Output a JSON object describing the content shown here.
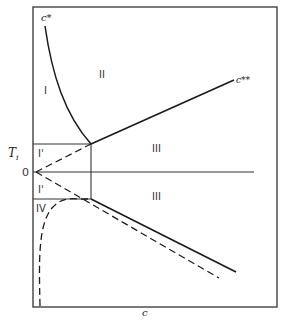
{
  "diagram": {
    "type": "phase-diagram",
    "axis": {
      "x_label": "c",
      "y_label": "T",
      "y_label_subscript": "i",
      "origin_label": "0"
    },
    "regions": [
      {
        "id": "I",
        "label": "I"
      },
      {
        "id": "II",
        "label": "II"
      },
      {
        "id": "III-upper",
        "label": "III"
      },
      {
        "id": "III-lower",
        "label": "III"
      },
      {
        "id": "I-prime-upper",
        "label": "I'"
      },
      {
        "id": "I-prime-lower",
        "label": "I'"
      },
      {
        "id": "IV",
        "label": "IV"
      }
    ],
    "curve_labels": {
      "c_star": "c*",
      "c_double_star": "c**"
    },
    "colors": {
      "line": "#1a1a1a",
      "frame": "#333333",
      "background": "#ffffff"
    }
  }
}
